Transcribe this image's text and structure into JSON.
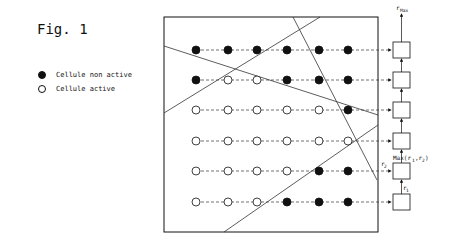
{
  "figure": {
    "title": "Fig. 1",
    "legend": [
      {
        "symbol": "filled-circle",
        "label": "Cellule non active"
      },
      {
        "symbol": "open-circle",
        "label": "Cellule active"
      }
    ],
    "output_labels": {
      "top": "r_Max",
      "max": "Max(r_1,r_2)",
      "r2": "r_2",
      "r1": "r_1"
    },
    "grid": {
      "columns": 6,
      "rows": [
        [
          "F",
          "F",
          "F",
          "F",
          "F",
          "F"
        ],
        [
          "F",
          "O",
          "O",
          "F",
          "F",
          "F"
        ],
        [
          "O",
          "O",
          "O",
          "O",
          "O",
          "F"
        ],
        [
          "O",
          "O",
          "O",
          "O",
          "O",
          "O"
        ],
        [
          "O",
          "O",
          "O",
          "O",
          "F",
          "F"
        ],
        [
          "O",
          "O",
          "O",
          "F",
          "F",
          "F"
        ]
      ]
    },
    "colors": {
      "ink": "#111111",
      "background": "#ffffff"
    }
  }
}
